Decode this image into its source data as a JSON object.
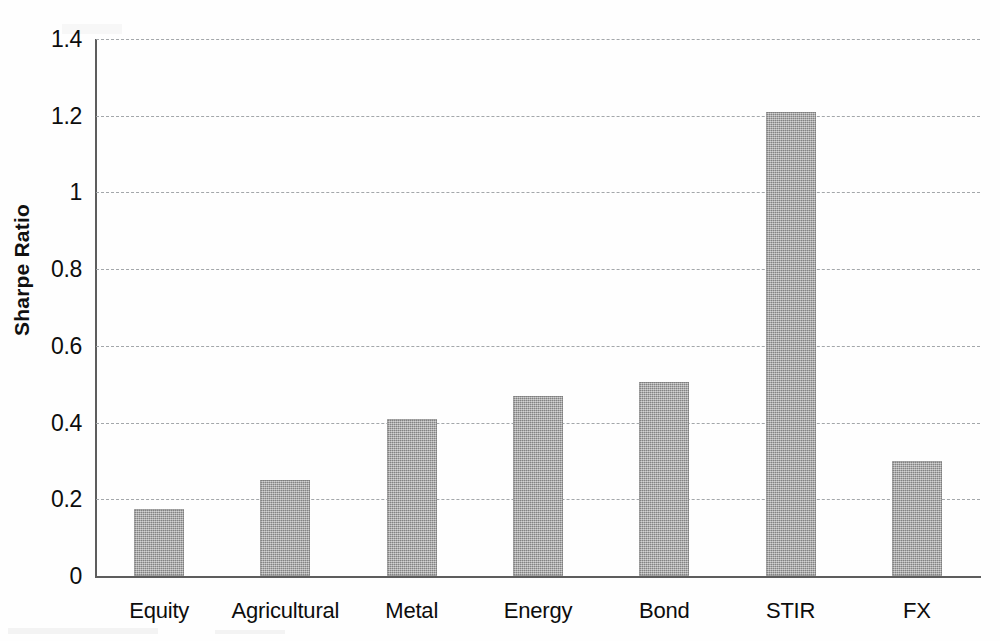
{
  "chart_data": {
    "type": "bar",
    "title": "",
    "subtitle": "",
    "xlabel": "",
    "ylabel": "Sharpe Ratio",
    "categories": [
      "Equity",
      "Agricultural",
      "Metal",
      "Energy",
      "Bond",
      "STIR",
      "FX"
    ],
    "values": [
      0.175,
      0.25,
      0.41,
      0.47,
      0.505,
      1.21,
      0.3
    ],
    "series": [
      {
        "name": "Sharpe Ratio",
        "values": [
          0.175,
          0.25,
          0.41,
          0.47,
          0.505,
          1.21,
          0.3
        ]
      }
    ],
    "ylim": [
      0,
      1.4
    ],
    "yticks": [
      0,
      0.2,
      0.4,
      0.6,
      0.8,
      1,
      1.2,
      1.4
    ],
    "ytick_labels": [
      "0",
      "0.2",
      "0.4",
      "0.6",
      "0.8",
      "1",
      "1.2",
      "1.4"
    ],
    "grid": "horizontal-dashed",
    "legend": "none",
    "bar_color": "#a0a0a0",
    "axis_color": "#5d5d5d",
    "grid_color": "#9fa3a6"
  }
}
